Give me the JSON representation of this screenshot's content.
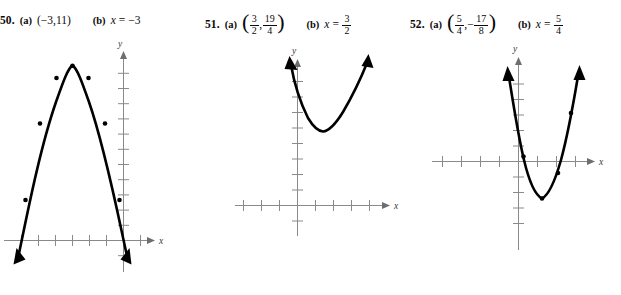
{
  "page": {
    "background_color": "#ffffff",
    "ink_color": "#000000",
    "axis_color": "#8a8a8a"
  },
  "problems": [
    {
      "number": "50.",
      "part_a_label": "(a)",
      "part_a_value": "(−3,11)",
      "part_b_label": "(b)",
      "part_b_var": "x",
      "part_b_eq": "=",
      "part_b_value": "−3",
      "x_axis_label": "x",
      "y_axis_label": "y",
      "graph": {
        "type": "parabola",
        "direction": "opens-down",
        "vertex": [
          -3,
          11
        ],
        "axis_of_symmetry": -3,
        "crosses_x_axis": true,
        "marked_points": 7,
        "arrow_ends": [
          "down-left",
          "down-right"
        ]
      }
    },
    {
      "number": "51.",
      "part_a_label": "(a)",
      "part_a_open_paren": "(",
      "part_a_close_paren": ")",
      "part_a_num1": "3",
      "part_a_den1": "2",
      "part_a_comma": ",",
      "part_a_num2": "19",
      "part_a_den2": "4",
      "part_b_label": "(b)",
      "part_b_var": "x",
      "part_b_eq": "=",
      "part_b_num": "3",
      "part_b_den": "2",
      "x_axis_label": "x",
      "y_axis_label": "y",
      "graph": {
        "type": "parabola",
        "direction": "opens-up",
        "vertex": [
          1.5,
          4.75
        ],
        "axis_of_symmetry": 1.5,
        "crosses_x_axis": false,
        "marked_points": 0,
        "arrow_ends": [
          "up-left",
          "up-right"
        ]
      }
    },
    {
      "number": "52.",
      "part_a_label": "(a)",
      "part_a_open_paren": "(",
      "part_a_close_paren": ")",
      "part_a_num1": "5",
      "part_a_den1": "4",
      "part_a_comma": ",",
      "part_a_minus": "−",
      "part_a_num2": "17",
      "part_a_den2": "8",
      "part_b_label": "(b)",
      "part_b_var": "x",
      "part_b_eq": "=",
      "part_b_num": "5",
      "part_b_den": "4",
      "x_axis_label": "x",
      "y_axis_label": "y",
      "graph": {
        "type": "parabola",
        "direction": "opens-up",
        "vertex": [
          1.25,
          -2.125
        ],
        "axis_of_symmetry": 1.25,
        "crosses_x_axis": true,
        "marked_points": 4,
        "arrow_ends": [
          "up-left",
          "up-right"
        ]
      }
    }
  ]
}
